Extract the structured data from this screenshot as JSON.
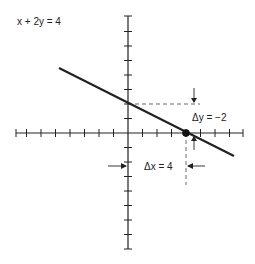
{
  "figure": {
    "equation_label": "x + 2y = 4",
    "delta_y_label": "Δy = −2",
    "delta_x_label": "Δx = 4",
    "colors": {
      "ink": "#222222",
      "background": "#ffffff"
    }
  },
  "chart_data": {
    "type": "line",
    "title": "x + 2y = 4",
    "xlabel": "",
    "ylabel": "",
    "x_range": [
      -8,
      8
    ],
    "y_range": [
      -8,
      8
    ],
    "grid": false,
    "tick_spacing": 1,
    "line": {
      "slope": -0.5,
      "intercept": 2,
      "x_start": -4.7,
      "x_end": 7.4
    },
    "points": [
      {
        "x": 0,
        "y": 2,
        "label": "y-intercept"
      },
      {
        "x": 4,
        "y": 0,
        "label": "x-intercept (marked dot)"
      }
    ],
    "annotations": [
      {
        "text": "Δy = −2",
        "from": [
          4,
          2
        ],
        "to": [
          4,
          0
        ]
      },
      {
        "text": "Δx = 4",
        "from": [
          0,
          -2
        ],
        "to": [
          4,
          -2
        ]
      }
    ]
  }
}
